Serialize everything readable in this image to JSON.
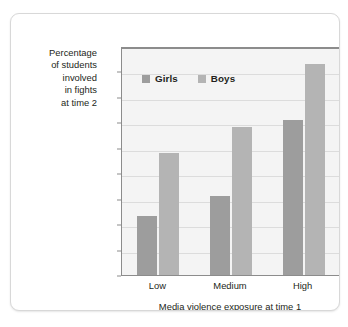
{
  "chart_data": {
    "type": "bar",
    "title": "",
    "categories": [
      "Low",
      "Medium",
      "High"
    ],
    "series": [
      {
        "name": "Girls",
        "values": [
          23,
          31,
          61
        ],
        "color": "#9d9d9d"
      },
      {
        "name": "Boys",
        "values": [
          48,
          58,
          83
        ],
        "color": "#b4b4b4"
      }
    ],
    "xlabel": "Media violence exposure at time 1",
    "ylabel": "Percentage of students involved in fights at time 2",
    "ylabel_lines": [
      "Percentage",
      "of students",
      "involved",
      "in fights",
      "at time 2"
    ],
    "ylim": [
      0,
      90
    ],
    "ytick_values": [
      90,
      80,
      70,
      60,
      50,
      40,
      30,
      20,
      10,
      0
    ],
    "ytick_labels": [
      "90%",
      "80",
      "70",
      "60",
      "50",
      "40",
      "30",
      "20",
      "10",
      "0"
    ],
    "grid": true,
    "legend_position": "upper-left-inside",
    "plot_background": "#f4f4f4",
    "axis_color": "#8c8c8c",
    "gridline_color": "#dcdcdc",
    "text_color": "#231f20"
  },
  "legend": {
    "entries": [
      {
        "label": "Girls",
        "color": "#9d9d9d"
      },
      {
        "label": "Boys",
        "color": "#b4b4b4"
      }
    ]
  },
  "card": {
    "border_color": "#d8d8d8",
    "background": "#ffffff"
  }
}
